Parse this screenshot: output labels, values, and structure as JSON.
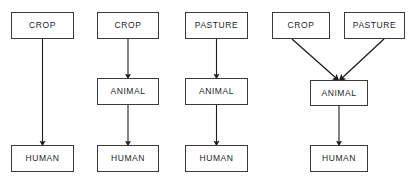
{
  "diagram": {
    "type": "flow-diagram",
    "background_color": "#ffffff",
    "box_border_color": "#3b3b3b",
    "box_fill_color": "#ffffff",
    "text_color": "#1d1d1d",
    "arrow_color": "#1d1d1d",
    "column_count": 4,
    "columns": [
      {
        "id": "col-1",
        "name": "crop-to-human",
        "nodes": [
          {
            "id": "c1-crop",
            "label": "CROP",
            "x": 11,
            "y": 12,
            "w": 63,
            "h": 27
          },
          {
            "id": "c1-human",
            "label": "HUMAN",
            "x": 11,
            "y": 145,
            "w": 63,
            "h": 27
          }
        ],
        "edges": [
          {
            "from": "c1-crop",
            "to": "c1-human",
            "x1": 42.5,
            "y1": 39,
            "x2": 42.5,
            "y2": 145,
            "kind": "straight"
          }
        ]
      },
      {
        "id": "col-2",
        "name": "crop-animal-human",
        "nodes": [
          {
            "id": "c2-crop",
            "label": "CROP",
            "x": 97,
            "y": 12,
            "w": 62,
            "h": 27
          },
          {
            "id": "c2-animal",
            "label": "ANIMAL",
            "x": 97,
            "y": 78,
            "w": 62,
            "h": 27
          },
          {
            "id": "c2-human",
            "label": "HUMAN",
            "x": 97,
            "y": 145,
            "w": 62,
            "h": 27
          }
        ],
        "edges": [
          {
            "from": "c2-crop",
            "to": "c2-animal",
            "x1": 128,
            "y1": 39,
            "x2": 128,
            "y2": 78,
            "kind": "straight"
          },
          {
            "from": "c2-animal",
            "to": "c2-human",
            "x1": 128,
            "y1": 105,
            "x2": 128,
            "y2": 145,
            "kind": "straight"
          }
        ]
      },
      {
        "id": "col-3",
        "name": "pasture-animal-human",
        "nodes": [
          {
            "id": "c3-pasture",
            "label": "PASTURE",
            "x": 185,
            "y": 12,
            "w": 63,
            "h": 27
          },
          {
            "id": "c3-animal",
            "label": "ANIMAL",
            "x": 185,
            "y": 78,
            "w": 63,
            "h": 27
          },
          {
            "id": "c3-human",
            "label": "HUMAN",
            "x": 185,
            "y": 145,
            "w": 63,
            "h": 27
          }
        ],
        "edges": [
          {
            "from": "c3-pasture",
            "to": "c3-animal",
            "x1": 216.5,
            "y1": 39,
            "x2": 216.5,
            "y2": 78,
            "kind": "straight"
          },
          {
            "from": "c3-animal",
            "to": "c3-human",
            "x1": 216.5,
            "y1": 105,
            "x2": 216.5,
            "y2": 145,
            "kind": "straight"
          }
        ]
      },
      {
        "id": "col-4",
        "name": "crop-and-pasture-to-animal-to-human",
        "nodes": [
          {
            "id": "c4-crop",
            "label": "CROP",
            "x": 272,
            "y": 12,
            "w": 58,
            "h": 27
          },
          {
            "id": "c4-pasture",
            "label": "PASTURE",
            "x": 344,
            "y": 12,
            "w": 61,
            "h": 27
          },
          {
            "id": "c4-animal",
            "label": "ANIMAL",
            "x": 310,
            "y": 80,
            "w": 58,
            "h": 26
          },
          {
            "id": "c4-human",
            "label": "HUMAN",
            "x": 310,
            "y": 145,
            "w": 58,
            "h": 27
          }
        ],
        "edges": [
          {
            "from": "c4-crop",
            "to": "c4-animal",
            "x1": 292,
            "y1": 39,
            "x2": 337,
            "y2": 80,
            "kind": "diagonal"
          },
          {
            "from": "c4-pasture",
            "to": "c4-animal",
            "x1": 384,
            "y1": 39,
            "x2": 341,
            "y2": 80,
            "kind": "diagonal"
          },
          {
            "from": "c4-animal",
            "to": "c4-human",
            "x1": 339,
            "y1": 106,
            "x2": 339,
            "y2": 145,
            "kind": "straight"
          }
        ]
      }
    ]
  }
}
